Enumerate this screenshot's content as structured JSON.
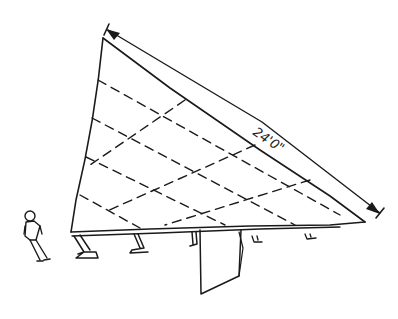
{
  "drawing": {
    "type": "hand-drawn architectural sketch",
    "subject": "triangular tilted panel structure on legs with scale figure",
    "dimension_label": "24'0\"",
    "ink_color": "#1a1a1a",
    "background_color": "#ffffff"
  }
}
